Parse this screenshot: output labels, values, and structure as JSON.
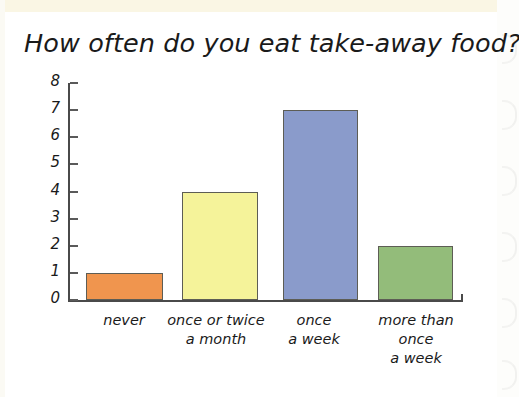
{
  "chart_data": {
    "type": "bar",
    "title": "How often do you eat take-away food?",
    "xlabel": "",
    "ylabel": "",
    "ylim": [
      0,
      8
    ],
    "grid": false,
    "legend": null,
    "y_ticks": [
      "8",
      "7",
      "6",
      "5",
      "4",
      "3",
      "2",
      "1",
      "0"
    ],
    "categories": [
      "never",
      "once or twice\na month",
      "once\na week",
      "more than\nonce\na week"
    ],
    "values": [
      1,
      4,
      7,
      2
    ],
    "bar_colors": [
      "#f0954e",
      "#f5f39a",
      "#8a9bcb",
      "#93bc7a"
    ],
    "bar_border_color": "#5d5d55"
  },
  "page": {
    "background_color": "#ffffff",
    "paper_strip_color": "#faf6e4"
  }
}
